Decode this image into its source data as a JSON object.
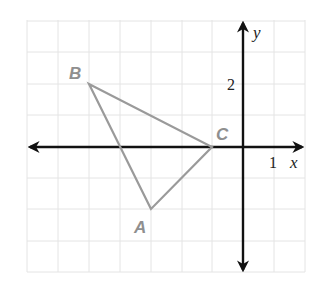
{
  "diagram": {
    "type": "coordinate-plane-triangle",
    "grid": {
      "x_min": -7,
      "x_max": 2,
      "y_min": -4,
      "y_max": 4,
      "unit_px": 31.2,
      "origin_px": [
        243,
        147
      ]
    },
    "axes": {
      "x_label": "x",
      "y_label": "y",
      "x_tick_label": "1",
      "y_tick_label": "2"
    },
    "vertices": [
      {
        "name": "A",
        "label": "A",
        "x": -3,
        "y": -2
      },
      {
        "name": "B",
        "label": "B",
        "x": -5,
        "y": 2
      },
      {
        "name": "C",
        "label": "C",
        "x": -1,
        "y": 0
      }
    ],
    "colors": {
      "triangle": "#9a9a9a",
      "axis": "#111111",
      "grid": "#e4e4e4"
    }
  }
}
